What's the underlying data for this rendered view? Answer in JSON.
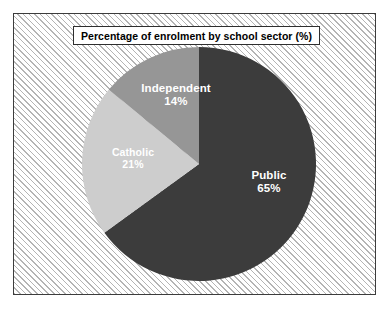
{
  "chart_data": {
    "type": "pie",
    "title": "Percentage of enrolment by school sector (%)",
    "xlabel": "",
    "ylabel": "",
    "unit": "%",
    "legend": "none",
    "grid": false,
    "start_angle_deg": 0,
    "direction": "clockwise",
    "categories": [
      "Public",
      "Catholic",
      "Independent"
    ],
    "values": [
      65,
      21,
      14
    ],
    "slices": [
      {
        "label": "Public",
        "value": 65,
        "value_text": "65%",
        "color": "#3c3c3c",
        "start_deg": 0,
        "sweep_deg": 234
      },
      {
        "label": "Catholic",
        "value": 21,
        "value_text": "21%",
        "color": "#cdcdcd",
        "start_deg": 234,
        "sweep_deg": 75.6
      },
      {
        "label": "Independent",
        "value": 14,
        "value_text": "14%",
        "color": "#969696",
        "start_deg": 309.6,
        "sweep_deg": 50.4
      }
    ]
  },
  "figure": {
    "title": "Percentage of enrolment by school sector (%)",
    "panel_background": "#ffffff",
    "panel_hatch_color": "#b4b4b4",
    "panel_border_color": "#3c3c3c",
    "label_text_color": "#ffffff",
    "title_text_color": "#000000"
  },
  "labels": {
    "independent": {
      "name": "Independent",
      "value_text": "14%"
    },
    "catholic": {
      "name": "Catholic",
      "value_text": "21%"
    },
    "public": {
      "name": "Public",
      "value_text": "65%"
    }
  }
}
